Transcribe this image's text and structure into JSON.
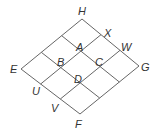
{
  "diagram": {
    "type": "rhombus-grid",
    "colors": {
      "line": "#666666",
      "label": "#333333",
      "background": "#ffffff"
    },
    "vertices": {
      "E": {
        "x": 21,
        "y": 69
      },
      "H": {
        "x": 82,
        "y": 19
      },
      "G": {
        "x": 139,
        "y": 66
      },
      "F": {
        "x": 80,
        "y": 114
      }
    },
    "labels": [
      {
        "id": "H",
        "text": "H",
        "x": 78,
        "y": 15
      },
      {
        "id": "X",
        "text": "X",
        "x": 104,
        "y": 37
      },
      {
        "id": "W",
        "text": "W",
        "x": 121,
        "y": 51
      },
      {
        "id": "G",
        "text": "G",
        "x": 141,
        "y": 71
      },
      {
        "id": "A",
        "text": "A",
        "x": 76,
        "y": 51
      },
      {
        "id": "B",
        "text": "B",
        "x": 57,
        "y": 66
      },
      {
        "id": "C",
        "text": "C",
        "x": 95,
        "y": 66
      },
      {
        "id": "D",
        "text": "D",
        "x": 74,
        "y": 83
      },
      {
        "id": "E",
        "text": "E",
        "x": 10,
        "y": 73
      },
      {
        "id": "U",
        "text": "U",
        "x": 32,
        "y": 95
      },
      {
        "id": "V",
        "text": "V",
        "x": 51,
        "y": 112
      },
      {
        "id": "F",
        "text": "F",
        "x": 75,
        "y": 128
      }
    ]
  }
}
